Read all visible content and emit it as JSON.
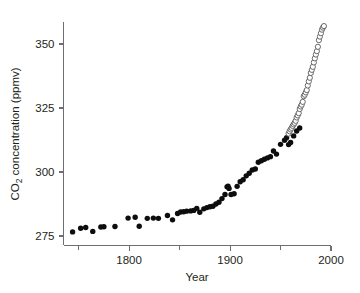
{
  "chart_data": {
    "type": "scatter",
    "title": "",
    "xlabel": "Year",
    "ylabel_main": "CO",
    "ylabel_sub": "2",
    "ylabel_rest": " concentration (ppmv)",
    "ylabel_full": "CO2 concentration (ppmv)",
    "xlim": [
      1735,
      2000
    ],
    "ylim": [
      271,
      357
    ],
    "xticks": [
      1800,
      1900,
      2000
    ],
    "xtick_labels": [
      "1800",
      "1900",
      "2000"
    ],
    "xticks_minor": [
      1750,
      1850,
      1950
    ],
    "yticks": [
      275,
      300,
      325,
      350
    ],
    "ytick_labels": [
      "275",
      "300",
      "325",
      "350"
    ],
    "grid": false,
    "legend": "none",
    "colors": {
      "filled_marker": "#0d0d0d",
      "open_marker_stroke": "#58595b",
      "open_marker_fill": "#ffffff",
      "axis": "#6d6e71",
      "text": "#231f20",
      "background": "#ffffff"
    },
    "series": [
      {
        "name": "Ice core record",
        "marker": "filled-circle",
        "points": [
          [
            1744,
            276.6
          ],
          [
            1752,
            278.0
          ],
          [
            1757,
            278.3
          ],
          [
            1764,
            276.8
          ],
          [
            1772,
            278.5
          ],
          [
            1775,
            278.6
          ],
          [
            1786,
            278.7
          ],
          [
            1799,
            282.0
          ],
          [
            1806,
            282.3
          ],
          [
            1810,
            278.8
          ],
          [
            1818,
            281.9
          ],
          [
            1824,
            282.0
          ],
          [
            1829,
            281.9
          ],
          [
            1838,
            283.0
          ],
          [
            1843,
            281.3
          ],
          [
            1848,
            283.8
          ],
          [
            1851,
            284.4
          ],
          [
            1854,
            284.5
          ],
          [
            1857,
            284.7
          ],
          [
            1861,
            284.8
          ],
          [
            1864,
            285.0
          ],
          [
            1867,
            285.8
          ],
          [
            1870,
            284.3
          ],
          [
            1874,
            285.6
          ],
          [
            1877,
            286.1
          ],
          [
            1880,
            286.4
          ],
          [
            1883,
            286.6
          ],
          [
            1886,
            287.5
          ],
          [
            1889,
            288.2
          ],
          [
            1892,
            289.6
          ],
          [
            1895,
            291.2
          ],
          [
            1897,
            294.2
          ],
          [
            1898,
            294.5
          ],
          [
            1899,
            293.6
          ],
          [
            1901,
            291.2
          ],
          [
            1904,
            291.5
          ],
          [
            1907,
            294.4
          ],
          [
            1910,
            296.2
          ],
          [
            1913,
            297.0
          ],
          [
            1916,
            298.5
          ],
          [
            1919,
            299.5
          ],
          [
            1922,
            300.8
          ],
          [
            1925,
            301.2
          ],
          [
            1928,
            303.8
          ],
          [
            1931,
            304.4
          ],
          [
            1934,
            305.0
          ],
          [
            1937,
            305.5
          ],
          [
            1940,
            306.0
          ],
          [
            1943,
            308.2
          ],
          [
            1946,
            307.0
          ],
          [
            1950,
            310.8
          ],
          [
            1954,
            312.4
          ],
          [
            1956,
            313.4
          ],
          [
            1958,
            310.7
          ],
          [
            1960,
            311.5
          ],
          [
            1963,
            314.1
          ],
          [
            1966,
            316.0
          ],
          [
            1969,
            317.2
          ]
        ]
      },
      {
        "name": "Mauna Loa direct measurements",
        "marker": "open-circle",
        "points": [
          [
            1958,
            315.0
          ],
          [
            1959,
            315.9
          ],
          [
            1960,
            316.6
          ],
          [
            1961,
            317.2
          ],
          [
            1962,
            318.0
          ],
          [
            1963,
            318.6
          ],
          [
            1964,
            319.2
          ],
          [
            1965,
            320.0
          ],
          [
            1966,
            321.3
          ],
          [
            1967,
            322.1
          ],
          [
            1968,
            323.0
          ],
          [
            1969,
            324.6
          ],
          [
            1970,
            325.6
          ],
          [
            1971,
            326.3
          ],
          [
            1972,
            327.4
          ],
          [
            1973,
            329.6
          ],
          [
            1974,
            330.2
          ],
          [
            1975,
            331.1
          ],
          [
            1976,
            332.0
          ],
          [
            1977,
            333.8
          ],
          [
            1978,
            335.4
          ],
          [
            1979,
            336.8
          ],
          [
            1980,
            338.7
          ],
          [
            1981,
            339.9
          ],
          [
            1982,
            341.1
          ],
          [
            1983,
            342.8
          ],
          [
            1984,
            344.4
          ],
          [
            1985,
            345.9
          ],
          [
            1986,
            347.2
          ],
          [
            1987,
            348.9
          ],
          [
            1988,
            351.5
          ],
          [
            1989,
            352.9
          ],
          [
            1990,
            354.2
          ],
          [
            1991,
            355.6
          ],
          [
            1992,
            356.4
          ],
          [
            1993,
            357.0
          ]
        ]
      }
    ]
  }
}
